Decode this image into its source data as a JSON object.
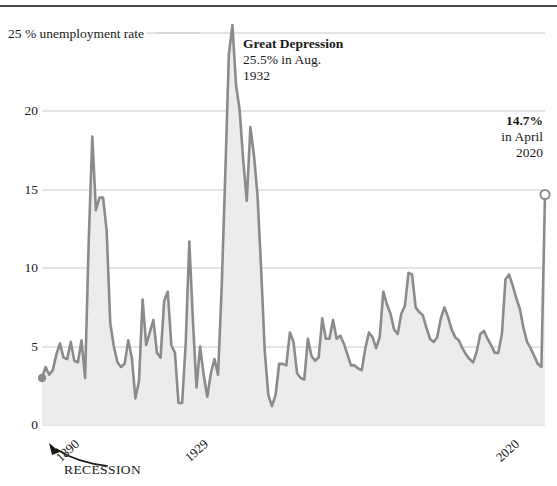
{
  "chart_data": {
    "type": "area",
    "title": "",
    "subtitle": "",
    "xlabel": "",
    "ylabel": "25 % unemployment rate",
    "ylim": [
      0,
      26.5
    ],
    "xlim": [
      1880,
      2020
    ],
    "grid": true,
    "legend": "none",
    "y_ticks": [
      {
        "value": 25,
        "label": "25 % unemployment rate"
      },
      {
        "value": 20,
        "label": "20"
      },
      {
        "value": 15,
        "label": "15"
      },
      {
        "value": 10,
        "label": "10"
      },
      {
        "value": 5,
        "label": "5"
      },
      {
        "value": 0,
        "label": "0"
      }
    ],
    "x_ticks": [
      {
        "value": 1890,
        "label": "1890"
      },
      {
        "value": 1929,
        "label": "1929"
      },
      {
        "value": 2020,
        "label": "2020"
      }
    ],
    "series": [
      {
        "name": "US unemployment rate",
        "line_color": "#8b8b8b",
        "fill_color": "#ececec",
        "x": [
          1880,
          1881,
          1882,
          1883,
          1884,
          1885,
          1886,
          1887,
          1888,
          1889,
          1890,
          1891,
          1892,
          1893,
          1894,
          1895,
          1896,
          1897,
          1898,
          1899,
          1900,
          1901,
          1902,
          1903,
          1904,
          1905,
          1906,
          1907,
          1908,
          1909,
          1910,
          1911,
          1912,
          1913,
          1914,
          1915,
          1916,
          1917,
          1918,
          1919,
          1920,
          1921,
          1922,
          1923,
          1924,
          1925,
          1926,
          1927,
          1928,
          1929,
          1930,
          1931,
          1932,
          1933,
          1934,
          1935,
          1936,
          1937,
          1938,
          1939,
          1940,
          1941,
          1942,
          1943,
          1944,
          1945,
          1946,
          1947,
          1948,
          1949,
          1950,
          1951,
          1952,
          1953,
          1954,
          1955,
          1956,
          1957,
          1958,
          1959,
          1960,
          1961,
          1962,
          1963,
          1964,
          1965,
          1966,
          1967,
          1968,
          1969,
          1970,
          1971,
          1972,
          1973,
          1974,
          1975,
          1976,
          1977,
          1978,
          1979,
          1980,
          1981,
          1982,
          1983,
          1984,
          1985,
          1986,
          1987,
          1988,
          1989,
          1990,
          1991,
          1992,
          1993,
          1994,
          1995,
          1996,
          1997,
          1998,
          1999,
          2000,
          2001,
          2002,
          2003,
          2004,
          2005,
          2006,
          2007,
          2008,
          2009,
          2010,
          2011,
          2012,
          2013,
          2014,
          2015,
          2016,
          2017,
          2018,
          2019,
          2020
        ],
        "values": [
          3.0,
          3.7,
          3.2,
          3.5,
          4.5,
          5.2,
          4.3,
          4.2,
          5.3,
          4.1,
          4.0,
          5.4,
          3.0,
          11.7,
          18.4,
          13.7,
          14.5,
          14.5,
          12.4,
          6.5,
          5.0,
          4.0,
          3.7,
          3.9,
          5.4,
          4.3,
          1.7,
          2.8,
          8.0,
          5.1,
          5.9,
          6.7,
          4.6,
          4.3,
          7.9,
          8.5,
          5.1,
          4.6,
          1.4,
          1.4,
          5.2,
          11.7,
          6.7,
          2.4,
          5.0,
          3.2,
          1.8,
          3.3,
          4.2,
          3.2,
          8.7,
          15.9,
          23.6,
          25.5,
          21.7,
          20.1,
          16.9,
          14.3,
          19.0,
          17.2,
          14.6,
          9.9,
          4.7,
          1.9,
          1.2,
          1.9,
          3.9,
          3.9,
          3.8,
          5.9,
          5.3,
          3.3,
          3.0,
          2.9,
          5.5,
          4.4,
          4.1,
          4.3,
          6.8,
          5.5,
          5.5,
          6.7,
          5.5,
          5.7,
          5.2,
          4.5,
          3.8,
          3.8,
          3.6,
          3.5,
          4.9,
          5.9,
          5.6,
          4.9,
          5.6,
          8.5,
          7.7,
          7.1,
          6.1,
          5.8,
          7.1,
          7.6,
          9.7,
          9.6,
          7.5,
          7.2,
          7.0,
          6.2,
          5.5,
          5.3,
          5.6,
          6.8,
          7.5,
          6.9,
          6.1,
          5.6,
          5.4,
          4.9,
          4.5,
          4.2,
          4.0,
          4.7,
          5.8,
          6.0,
          5.5,
          5.1,
          4.6,
          4.6,
          5.8,
          9.3,
          9.6,
          8.9,
          8.1,
          7.4,
          6.2,
          5.3,
          4.9,
          4.4,
          3.9,
          3.7,
          14.7
        ]
      }
    ],
    "annotations": [
      {
        "name": "great-depression",
        "heading": "Great Depression",
        "line2": "25.5% in Aug.",
        "line3": "1932",
        "value": 25.5,
        "year": 1932
      },
      {
        "name": "april-2020",
        "heading": "14.7%",
        "line2": "in April",
        "line3": "2020",
        "value": 14.7,
        "year": 2020
      },
      {
        "name": "recession-callout",
        "heading": "RECESSION",
        "line2": "",
        "line3": ""
      }
    ],
    "markers": [
      {
        "name": "series-start-dot",
        "x": 1880,
        "y": 3.0,
        "style": "filled"
      },
      {
        "name": "series-end-circle",
        "x": 2020,
        "y": 14.7,
        "style": "hollow"
      }
    ]
  }
}
